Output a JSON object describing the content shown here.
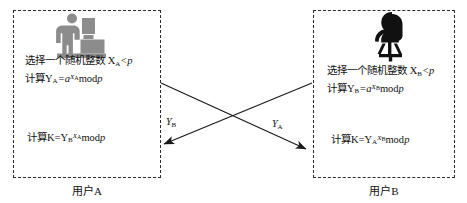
{
  "diagram": {
    "title_semantics": "diffie-hellman-key-exchange",
    "party_a": {
      "label": "用户A",
      "avatar_icon": "person-at-desktop-computer-icon",
      "avatar_color": "#8c8c8c",
      "step_choose": "选择一个随机整数 X",
      "step_choose_sub": "A",
      "step_choose_tail": "<p",
      "step_compute_lead": "计算Y",
      "step_compute_sub": "A",
      "step_compute_eq": "=a",
      "step_compute_exp": "X",
      "step_compute_exp_sub": "A",
      "step_compute_mod": "mod",
      "step_compute_p": "p",
      "key_lead": "计算K=Y",
      "key_sub": "B",
      "key_exp": "X",
      "key_exp_sub": "A",
      "key_mod": "mod",
      "key_p": "p"
    },
    "party_b": {
      "label": "用户B",
      "avatar_icon": "person-sitting-on-chair-silhouette-icon",
      "avatar_color": "#111111",
      "step_choose": "选择一个随机整数 X",
      "step_choose_sub": "B",
      "step_choose_tail": "<p",
      "step_compute_lead": "计算Y",
      "step_compute_sub": "B",
      "step_compute_eq": "=a",
      "step_compute_exp": "X",
      "step_compute_exp_sub": "B",
      "step_compute_mod": "mod",
      "step_compute_p": "p",
      "key_lead": "计算K=Y",
      "key_sub": "A",
      "key_exp": "X",
      "key_exp_sub": "B",
      "key_mod": "mod",
      "key_p": "p"
    },
    "wires": [
      {
        "name": "b-to-a",
        "label": "Y",
        "label_sub": "B"
      },
      {
        "name": "a-to-b",
        "label": "Y",
        "label_sub": "A"
      }
    ],
    "colors": {
      "stroke": "#2b2b2b",
      "text": "#111111",
      "background": "#ffffff"
    }
  }
}
